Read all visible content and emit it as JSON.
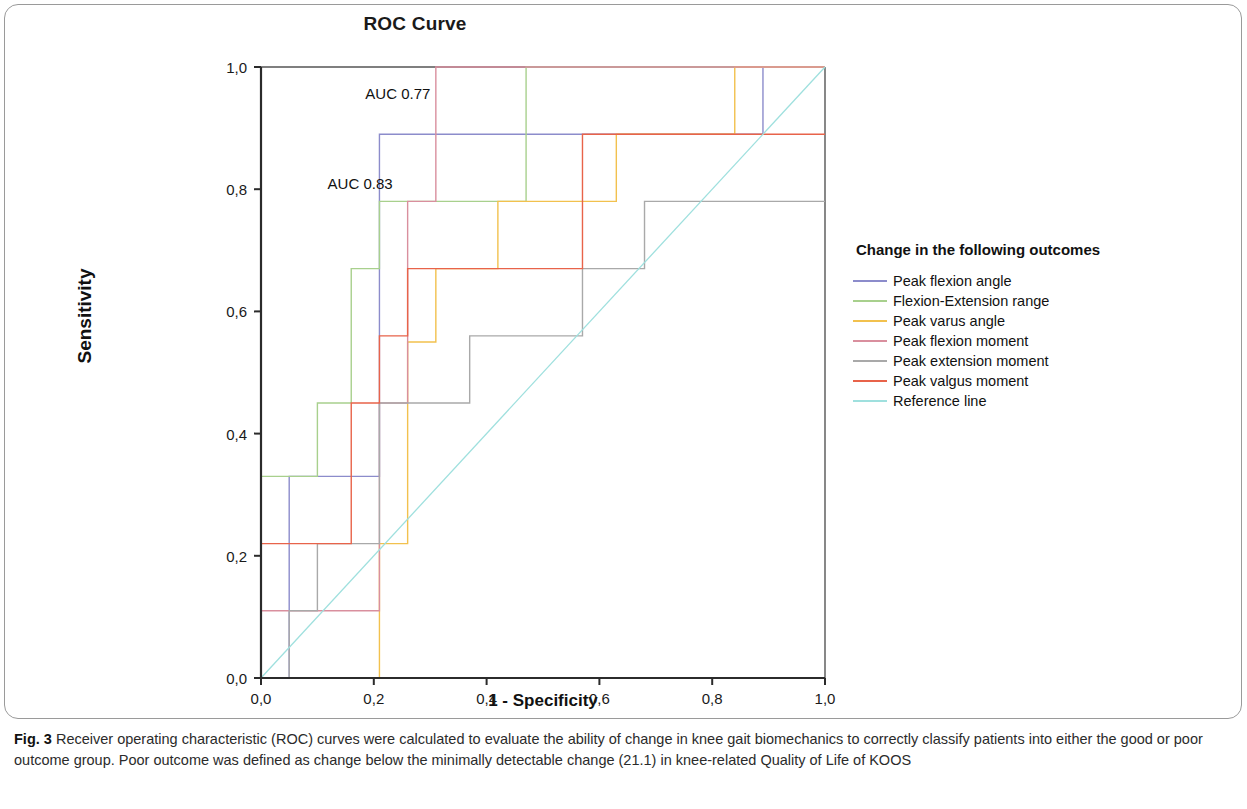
{
  "figure": {
    "label": "Fig. 3",
    "caption": "Receiver operating characteristic (ROC) curves were calculated to evaluate the ability of change in knee gait biomechanics to correctly classify patients into either the good or poor outcome group. Poor outcome was defined as change below the minimally detectable change (21.1) in knee-related Quality of Life of KOOS"
  },
  "chart_data": {
    "type": "line",
    "title": "ROC Curve",
    "xlabel": "1 - Specificity",
    "ylabel": "Sensitivity",
    "xlim": [
      0,
      1
    ],
    "ylim": [
      0,
      1
    ],
    "grid": false,
    "legend_position": "right",
    "legend_title": "Change in the following outcomes",
    "x_ticks": [
      0,
      0.2,
      0.4,
      0.6,
      0.8,
      1
    ],
    "x_tick_labels": [
      "0,0",
      "0,2",
      "0,4",
      "0,6",
      "0,8",
      "1,0"
    ],
    "y_ticks": [
      0,
      0.2,
      0.4,
      0.6,
      0.8,
      1
    ],
    "y_tick_labels": [
      "0,0",
      "0,2",
      "0,4",
      "0,6",
      "0,8",
      "1,0"
    ],
    "annotations": [
      {
        "text": "AUC 0.77",
        "x": 0.185,
        "y": 0.955
      },
      {
        "text": "AUC 0.83",
        "x": 0.118,
        "y": 0.808
      }
    ],
    "series": [
      {
        "name": "Peak flexion angle",
        "color": "#8c8ccb",
        "points": [
          [
            0,
            0
          ],
          [
            0.05,
            0
          ],
          [
            0.05,
            0.33
          ],
          [
            0.21,
            0.33
          ],
          [
            0.21,
            0.89
          ],
          [
            0.37,
            0.89
          ],
          [
            0.89,
            0.89
          ],
          [
            0.89,
            1
          ],
          [
            1,
            1
          ]
        ]
      },
      {
        "name": "Flexion-Extension range",
        "color": "#a8d08d",
        "points": [
          [
            0,
            0
          ],
          [
            0,
            0.33
          ],
          [
            0.1,
            0.33
          ],
          [
            0.1,
            0.45
          ],
          [
            0.16,
            0.45
          ],
          [
            0.16,
            0.67
          ],
          [
            0.21,
            0.67
          ],
          [
            0.21,
            0.78
          ],
          [
            0.47,
            0.78
          ],
          [
            0.47,
            1
          ],
          [
            1,
            1
          ]
        ]
      },
      {
        "name": "Peak varus angle",
        "color": "#f2c14e",
        "points": [
          [
            0,
            0
          ],
          [
            0.21,
            0
          ],
          [
            0.21,
            0.22
          ],
          [
            0.26,
            0.22
          ],
          [
            0.26,
            0.55
          ],
          [
            0.31,
            0.55
          ],
          [
            0.31,
            0.67
          ],
          [
            0.42,
            0.67
          ],
          [
            0.42,
            0.78
          ],
          [
            0.63,
            0.78
          ],
          [
            0.63,
            0.89
          ],
          [
            0.84,
            0.89
          ],
          [
            0.84,
            1
          ],
          [
            1,
            1
          ]
        ]
      },
      {
        "name": "Peak flexion moment",
        "color": "#d98f9e",
        "points": [
          [
            0,
            0
          ],
          [
            0,
            0.11
          ],
          [
            0.21,
            0.11
          ],
          [
            0.21,
            0.22
          ],
          [
            0.21,
            0.45
          ],
          [
            0.26,
            0.45
          ],
          [
            0.26,
            0.78
          ],
          [
            0.31,
            0.78
          ],
          [
            0.31,
            1
          ],
          [
            1,
            1
          ]
        ]
      },
      {
        "name": "Peak extension moment",
        "color": "#a9a9a9",
        "points": [
          [
            0,
            0
          ],
          [
            0.05,
            0
          ],
          [
            0.05,
            0.11
          ],
          [
            0.1,
            0.11
          ],
          [
            0.1,
            0.22
          ],
          [
            0.21,
            0.22
          ],
          [
            0.21,
            0.45
          ],
          [
            0.37,
            0.45
          ],
          [
            0.37,
            0.56
          ],
          [
            0.57,
            0.56
          ],
          [
            0.57,
            0.67
          ],
          [
            0.68,
            0.67
          ],
          [
            0.68,
            0.78
          ],
          [
            1,
            0.78
          ]
        ]
      },
      {
        "name": "Peak valgus moment",
        "color": "#e8634a",
        "points": [
          [
            0,
            0
          ],
          [
            0,
            0.22
          ],
          [
            0.16,
            0.22
          ],
          [
            0.16,
            0.45
          ],
          [
            0.21,
            0.45
          ],
          [
            0.21,
            0.56
          ],
          [
            0.26,
            0.56
          ],
          [
            0.26,
            0.67
          ],
          [
            0.57,
            0.67
          ],
          [
            0.57,
            0.89
          ],
          [
            1,
            0.89
          ]
        ]
      },
      {
        "name": "Reference line",
        "color": "#9fe0de",
        "points": [
          [
            0,
            0
          ],
          [
            1,
            1
          ]
        ]
      }
    ]
  }
}
